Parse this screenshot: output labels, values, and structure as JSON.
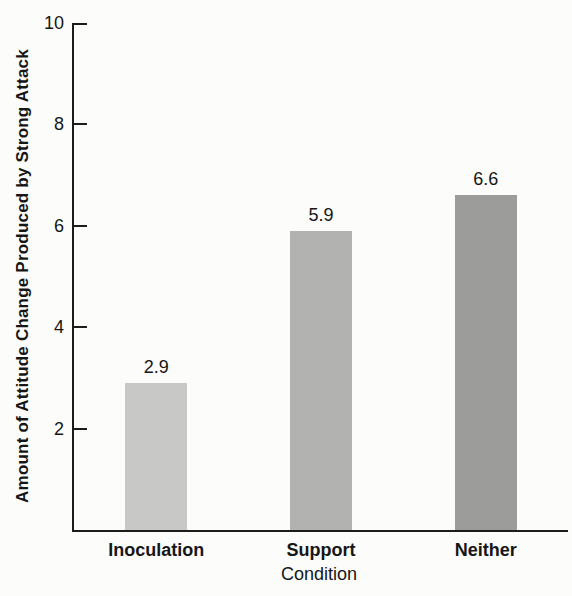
{
  "chart_data": {
    "type": "bar",
    "categories": [
      "Inoculation",
      "Support",
      "Neither"
    ],
    "values": [
      2.9,
      5.9,
      6.6
    ],
    "value_labels": [
      "2.9",
      "5.9",
      "6.6"
    ],
    "bar_colors": [
      "#c8c8c7",
      "#b2b2b1",
      "#9c9c9b"
    ],
    "title": "",
    "xlabel": "Condition",
    "ylabel": "Amount of Attitude Change Produced by Strong Attack",
    "ylim": [
      0,
      10
    ],
    "yticks": [
      10,
      8,
      6,
      4,
      2
    ],
    "grid": false,
    "legend_position": "none",
    "axis_color": "#1c1c1c",
    "text_color": "#161616",
    "background_color": "#fcfcfb"
  }
}
